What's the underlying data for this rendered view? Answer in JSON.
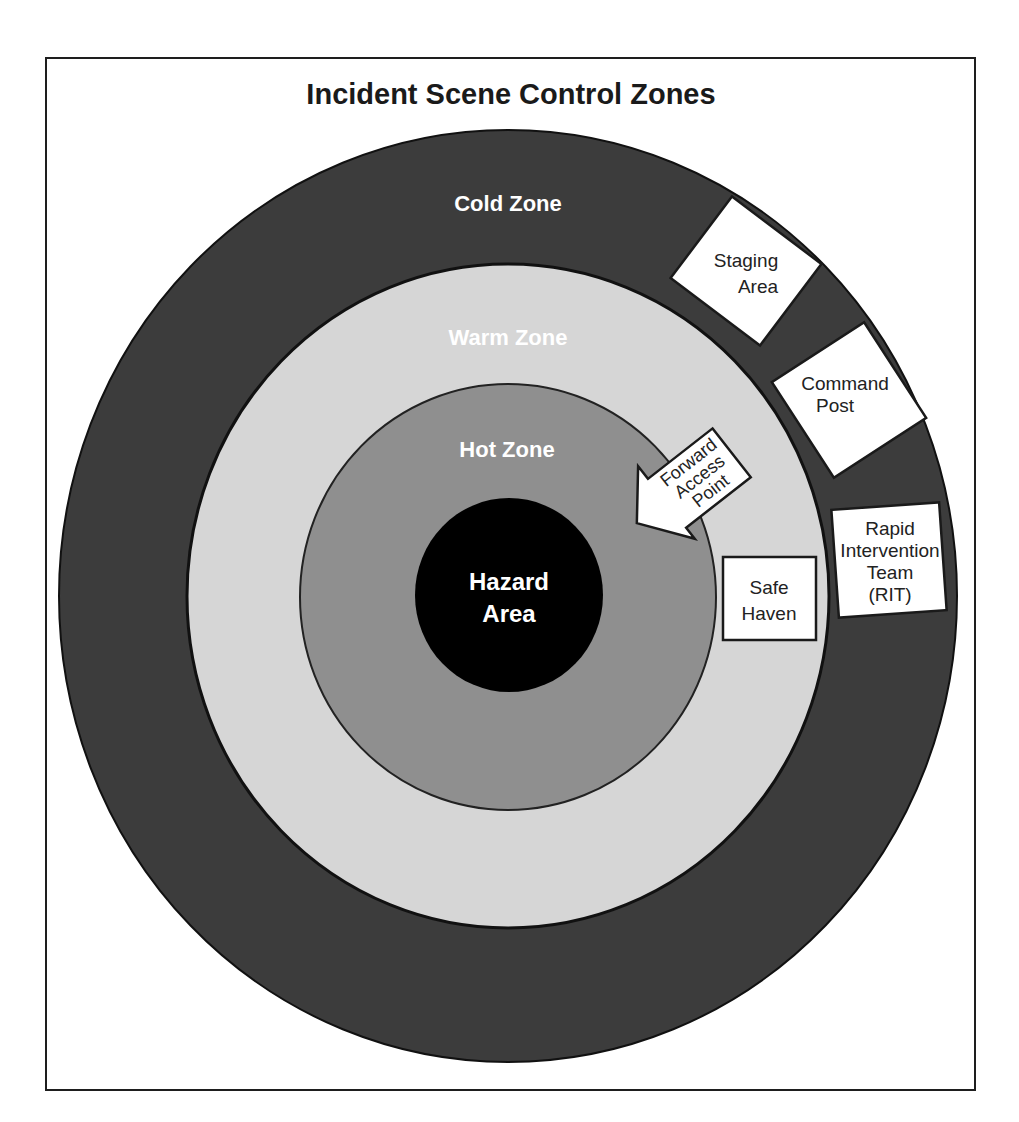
{
  "diagram": {
    "title": "Incident Scene Control Zones",
    "colors": {
      "cold_zone": "#3c3c3c",
      "warm_zone": "#d6d6d6",
      "hot_zone": "#8f8f8f",
      "hazard_area": "#000000",
      "frame": "#1e1e1e",
      "box_fill": "#ffffff"
    },
    "zones": {
      "cold": {
        "label": "Cold Zone"
      },
      "warm": {
        "label": "Warm Zone"
      },
      "hot": {
        "label": "Hot Zone"
      },
      "hazard": {
        "line1": "Hazard",
        "line2": "Area"
      }
    },
    "boxes": {
      "staging_area": {
        "line1": "Staging",
        "line2": "Area"
      },
      "command_post": {
        "line1": "Command",
        "line2": "Post"
      },
      "rit": {
        "line1": "Rapid",
        "line2": "Intervention",
        "line3": "Team",
        "line4": "(RIT)"
      },
      "safe_haven": {
        "line1": "Safe",
        "line2": "Haven"
      },
      "forward_access_point": {
        "line1": "Forward",
        "line2": "Access",
        "line3": "Point",
        "icon": "arrow-left-icon"
      }
    }
  }
}
